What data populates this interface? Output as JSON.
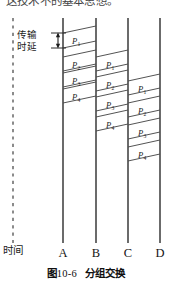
{
  "header": {
    "cropped_text": "这技术不的基本思想。"
  },
  "figure": {
    "caption_prefix": "图",
    "caption_number": "10-6",
    "caption_title": "分组交换",
    "time_axis_label": "时间",
    "delay_label_line1": "传输",
    "delay_label_line2": "时延"
  },
  "nodes": [
    {
      "label": "A",
      "x": 63
    },
    {
      "label": "B",
      "x": 96
    },
    {
      "label": "C",
      "x": 128
    },
    {
      "label": "D",
      "x": 160
    }
  ],
  "hops": [
    {
      "from": "A",
      "to": "B",
      "packets": [
        {
          "label": "P",
          "sub": "1",
          "top": 33
        },
        {
          "label": "P",
          "sub": "2",
          "top": 57
        },
        {
          "label": "P",
          "sub": "3",
          "top": 73
        },
        {
          "label": "P",
          "sub": "4",
          "top": 89
        }
      ]
    },
    {
      "from": "B",
      "to": "C",
      "packets": [
        {
          "label": "P",
          "sub": "1",
          "top": 57
        },
        {
          "label": "P",
          "sub": "2",
          "top": 77
        },
        {
          "label": "P",
          "sub": "3",
          "top": 97
        },
        {
          "label": "P",
          "sub": "4",
          "top": 117
        }
      ]
    },
    {
      "from": "C",
      "to": "D",
      "packets": [
        {
          "label": "P",
          "sub": "1",
          "top": 81
        },
        {
          "label": "P",
          "sub": "2",
          "top": 103
        },
        {
          "label": "P",
          "sub": "3",
          "top": 125
        },
        {
          "label": "P",
          "sub": "4",
          "top": 147
        }
      ]
    }
  ],
  "colors": {
    "line": "#3a3a3a",
    "band": "#4a4a4a",
    "dashed": "#6f6f6f",
    "text": "#1b1b1b",
    "background": "#ffffff"
  },
  "geometry": {
    "timeline_x": 13,
    "timeline_top": 18,
    "timeline_bottom": 243,
    "node_line_top": 18,
    "node_line_bottom": 243,
    "delay_arrow_x": 58,
    "delay_arrow_top": 33,
    "delay_arrow_bottom": 48
  }
}
